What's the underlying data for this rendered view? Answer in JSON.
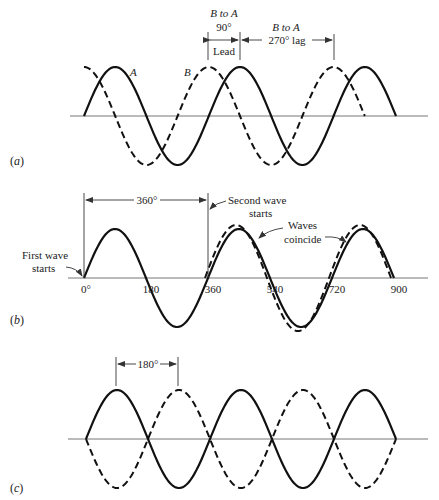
{
  "figure": {
    "panels": [
      {
        "id": "a",
        "panel_label": "(a)",
        "description": "Wave B leads wave A by 90° (equivalently lags by 270°)",
        "waves": [
          {
            "name": "A",
            "label": "A",
            "style": "solid",
            "phase_deg": 0,
            "start_deg": 0,
            "end_deg": 900
          },
          {
            "name": "B",
            "label": "B",
            "style": "dashed",
            "phase_deg": 90,
            "start_deg": 0,
            "end_deg": 810
          }
        ],
        "annotations": {
          "lead_top": "B to A",
          "lead_angle": "90°",
          "lead_word": "Lead",
          "lag_top": "B to A",
          "lag_text": "270° lag"
        }
      },
      {
        "id": "b",
        "panel_label": "(b)",
        "description": "Wave shifted by 360° coincides with the original",
        "waves": [
          {
            "name": "first",
            "style": "solid",
            "phase_deg": 0,
            "start_deg": 0,
            "end_deg": 900
          },
          {
            "name": "second",
            "style": "dashed",
            "phase_deg": 0,
            "start_deg": 360,
            "end_deg": 900
          }
        ],
        "tick_labels": [
          "0°",
          "180",
          "360",
          "540",
          "720",
          "900"
        ],
        "tick_values": [
          0,
          180,
          360,
          540,
          720,
          900
        ],
        "annotations": {
          "span": "360°",
          "first_wave_line1": "First wave",
          "first_wave_line2": "starts",
          "second_wave_line1": "Second wave",
          "second_wave_line2": "starts",
          "coincide_line1": "Waves",
          "coincide_line2": "coincide"
        }
      },
      {
        "id": "c",
        "panel_label": "(c)",
        "description": "Two waves 180° out of phase",
        "waves": [
          {
            "name": "solid",
            "style": "solid",
            "phase_deg": 0,
            "start_deg": 0,
            "end_deg": 900
          },
          {
            "name": "dashed",
            "style": "dashed",
            "phase_deg": 180,
            "start_deg": 0,
            "end_deg": 900
          }
        ],
        "annotations": {
          "span": "180°"
        }
      }
    ]
  }
}
